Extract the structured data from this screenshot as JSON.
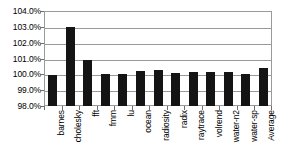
{
  "chart_data": {
    "type": "bar",
    "title": "",
    "subtitle": "",
    "xlabel": "",
    "ylabel": "",
    "categories": [
      "barnes",
      "cholesky",
      "fft",
      "fmm",
      "lu",
      "ocean",
      "radiosity",
      "radix",
      "raytrace",
      "volrend",
      "water-n2",
      "water-sp",
      "Average"
    ],
    "values": [
      99.95,
      103.0,
      100.9,
      100.05,
      100.0,
      100.2,
      100.3,
      100.1,
      100.12,
      100.15,
      100.12,
      100.05,
      100.43
    ],
    "value_format": "percent",
    "ylim": [
      98.0,
      104.0
    ],
    "yticks": [
      98.0,
      99.0,
      100.0,
      101.0,
      102.0,
      103.0,
      104.0
    ],
    "ytick_labels": [
      "98.0%",
      "99.0%",
      "100.0%",
      "101.0%",
      "102.0%",
      "103.0%",
      "104.0%"
    ],
    "grid": true,
    "grid_axis": "y",
    "legend": false,
    "legend_position": "none",
    "bar_color": "#141414",
    "grid_color": "#9a9a9a",
    "frame_color": "#9a9a9a",
    "background_color": "#ffffff",
    "text_color": "#000000",
    "xtick_label_rotation": -90
  }
}
